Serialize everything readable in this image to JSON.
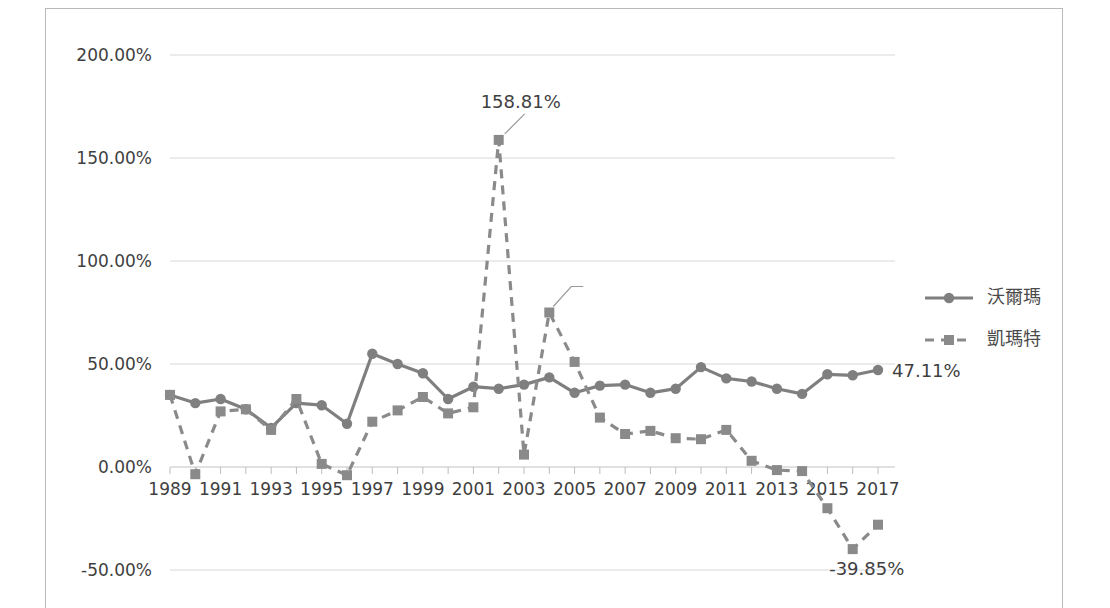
{
  "chart_data": {
    "type": "line",
    "title": "",
    "xlabel": "",
    "ylabel": "",
    "ylim": [
      -50,
      200
    ],
    "ytick_labels": [
      "200.00%",
      "150.00%",
      "100.00%",
      "50.00%",
      "0.00%",
      "-50.00%"
    ],
    "ytick_values": [
      200,
      150,
      100,
      50,
      0,
      -50
    ],
    "grid": true,
    "legend_position": "right",
    "x": [
      1989,
      1990,
      1991,
      1992,
      1993,
      1994,
      1995,
      1996,
      1997,
      1998,
      1999,
      2000,
      2001,
      2002,
      2003,
      2004,
      2005,
      2006,
      2007,
      2008,
      2009,
      2010,
      2011,
      2012,
      2013,
      2014,
      2015,
      2016,
      2017
    ],
    "xtick_labels": [
      "1989",
      "1991",
      "1993",
      "1995",
      "1997",
      "1999",
      "2001",
      "2003",
      "2005",
      "2007",
      "2009",
      "2011",
      "2013",
      "2015",
      "2017"
    ],
    "xtick_values": [
      1989,
      1991,
      1993,
      1995,
      1997,
      1999,
      2001,
      2003,
      2005,
      2007,
      2009,
      2011,
      2013,
      2015,
      2017
    ],
    "series": [
      {
        "name": "沃爾瑪",
        "style": "solid",
        "marker": "circle",
        "color": "#7f7f7f",
        "values": [
          35.0,
          31.0,
          33.0,
          28.0,
          19.0,
          31.0,
          30.0,
          21.0,
          55.0,
          50.0,
          45.5,
          33.0,
          39.0,
          38.0,
          40.0,
          43.5,
          36.0,
          39.5,
          40.0,
          36.0,
          38.0,
          48.5,
          43.0,
          41.5,
          38.0,
          35.5,
          45.0,
          44.5,
          47.11
        ]
      },
      {
        "name": "凱瑪特",
        "style": "dashed",
        "marker": "square",
        "color": "#8a8a8a",
        "values": [
          35.0,
          -3.5,
          27.0,
          28.0,
          18.0,
          33.0,
          1.5,
          -4.0,
          22.0,
          27.5,
          34.0,
          26.0,
          29.0,
          158.81,
          6.0,
          75.0,
          51.0,
          24.0,
          16.0,
          17.5,
          14.0,
          13.5,
          18.0,
          3.0,
          -1.5,
          -2.0,
          -20.0,
          -39.85,
          -28.0
        ]
      }
    ],
    "annotations": [
      {
        "name": "peak-annotation",
        "text": "158.81%",
        "x": 2002,
        "y": 158.81
      },
      {
        "name": "end-annotation",
        "text": "47.11%",
        "x": 2017,
        "y": 47.11
      },
      {
        "name": "trough-annotation",
        "text": "-39.85%",
        "x": 2016,
        "y": -39.85
      }
    ]
  },
  "legend": {
    "items": [
      {
        "label": "沃爾瑪",
        "style": "solid",
        "marker": "circle"
      },
      {
        "label": "凱瑪特",
        "style": "dashed",
        "marker": "square"
      }
    ]
  }
}
